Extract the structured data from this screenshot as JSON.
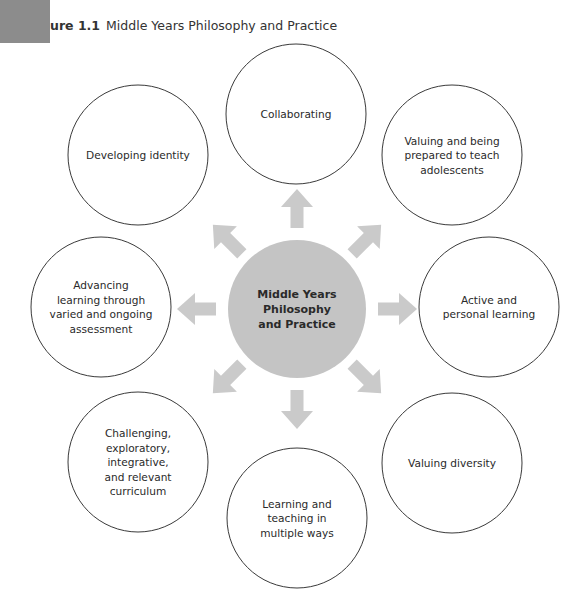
{
  "figure": {
    "label_prefix": "ure 1.1",
    "title": "Middle Years Philosophy and Practice"
  },
  "colors": {
    "corner_box": "#8c8c8c",
    "center_fill": "#c4c4c4",
    "arrow_fill": "#cacaca",
    "node_stroke": "#3a3a3a"
  },
  "center": {
    "lines": [
      "Middle Years",
      "Philosophy",
      "and Practice"
    ]
  },
  "nodes": [
    {
      "id": "collaborating",
      "direction": "up",
      "lines": [
        "Collaborating"
      ]
    },
    {
      "id": "valuing-adolescents",
      "direction": "up-right",
      "lines": [
        "Valuing and being",
        "prepared to teach",
        "adolescents"
      ]
    },
    {
      "id": "active-personal-learning",
      "direction": "right",
      "lines": [
        "Active and",
        "personal learning"
      ]
    },
    {
      "id": "valuing-diversity",
      "direction": "down-right",
      "lines": [
        "Valuing diversity"
      ]
    },
    {
      "id": "learning-teaching-multiple-ways",
      "direction": "down",
      "lines": [
        "Learning and",
        "teaching in",
        "multiple ways"
      ]
    },
    {
      "id": "challenging-curriculum",
      "direction": "down-left",
      "lines": [
        "Challenging,",
        "exploratory,",
        "integrative,",
        "and relevant",
        "curriculum"
      ]
    },
    {
      "id": "advancing-assessment",
      "direction": "left",
      "lines": [
        "Advancing",
        "learning through",
        "varied and ongoing",
        "assessment"
      ]
    },
    {
      "id": "developing-identity",
      "direction": "up-left",
      "lines": [
        "Developing identity"
      ]
    }
  ]
}
